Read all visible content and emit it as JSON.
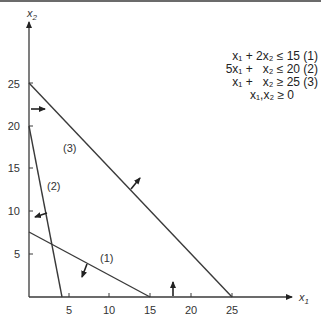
{
  "diagram": {
    "axes": {
      "x_label": "x1",
      "y_label": "x2",
      "x_ticks": [
        "5",
        "10",
        "15",
        "20",
        "25"
      ],
      "y_ticks": [
        "5",
        "10",
        "15",
        "20",
        "25"
      ]
    },
    "constraints": [
      {
        "id": "1",
        "text": "x₁ + 2x₂ ≤ 15 (1)",
        "label": "(1)",
        "equation": "x1 + 2x2 <= 15",
        "intercepts": {
          "x1": 15,
          "x2": 7.5
        }
      },
      {
        "id": "2",
        "text": "5x₁ +   x₂ ≤ 20 (2)",
        "label": "(2)",
        "equation": "5x1 + x2 <= 20",
        "intercepts": {
          "x1": 4,
          "x2": 20
        }
      },
      {
        "id": "3",
        "text": "x₁ +   x₂ ≥ 25 (3)",
        "label": "(3)",
        "equation": "x1 + x2 >= 25",
        "intercepts": {
          "x1": 25,
          "x2": 25
        }
      }
    ],
    "nonnegativity": "x₁,x₂ ≥ 0",
    "colors": {
      "lines": "#3a3a3a",
      "text": "#222222",
      "background": "#ffffff"
    }
  }
}
